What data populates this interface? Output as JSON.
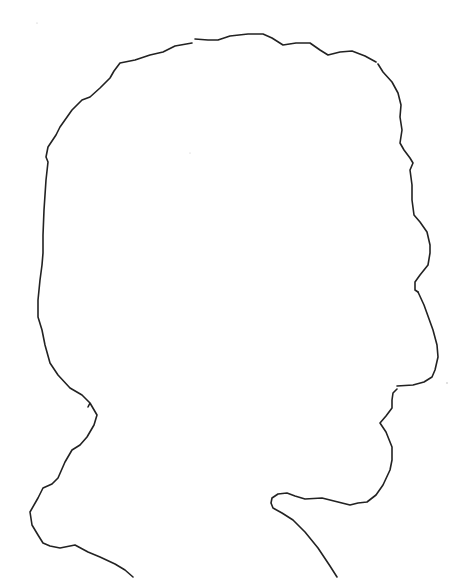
{
  "image": {
    "description": "Hand-drawn line art outline of a human head and shoulders in profile, facing right",
    "background_color": "#ffffff",
    "stroke_color": "#222222",
    "subject": "profile silhouette outline"
  }
}
